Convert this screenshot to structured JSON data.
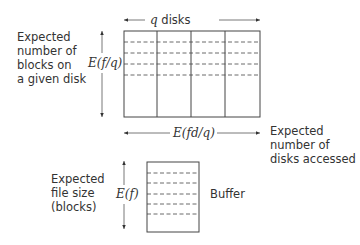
{
  "top_arrow_label": "q disks",
  "top_arrow_label_var": "q",
  "top_arrow_label_rest": " disks",
  "left_label": [
    "Expected",
    "number of",
    "blocks on",
    "a given disk"
  ],
  "left_var": "E(f/q)",
  "bottom_var": "E(fd/q)",
  "right_label": [
    "Expected",
    "number of",
    "disks accessed"
  ],
  "buffer_left_label": [
    "Expected",
    "file size",
    "(blocks)"
  ],
  "buffer_var": "E(f)",
  "buffer_label": "Buffer",
  "disk_count": 4,
  "block_rows_dashed": 4,
  "buffer_rows_dashed": 5
}
